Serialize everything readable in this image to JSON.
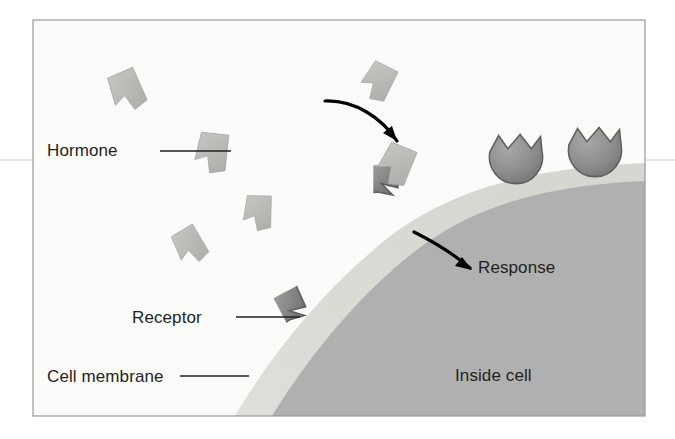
{
  "figure": {
    "background_color": "#ffffff",
    "panel": {
      "x": 33,
      "y": 20,
      "width": 612,
      "height": 396,
      "outside_fill": "#fbfbfa",
      "border_color": "#9a9a9a"
    },
    "colors": {
      "outside_cell": "#fbfbfa",
      "cell_membrane": "#dcdcd6",
      "inside_cell": "#b0b0b0",
      "hormone_fill": "#b9b9b6",
      "hormone_stroke": "#a3a3a0",
      "receptor_fill": "#8f8f8f",
      "receptor_stroke": "#5f5f5f",
      "text": "#231f20",
      "arrow": "#000000",
      "leader": "#231f20",
      "panel_border": "#9a9a9a",
      "scan_line": "#c9c9c9"
    },
    "labels": [
      {
        "id": "hormone",
        "text": "Hormone",
        "x": 47,
        "y": 156,
        "anchor": "start",
        "leader": "M 160 151 L 231 151"
      },
      {
        "id": "receptor",
        "text": "Receptor",
        "x": 132,
        "y": 323,
        "anchor": "start",
        "leader": "M 236 317 L 300 317"
      },
      {
        "id": "cell-membrane",
        "text": "Cell membrane",
        "x": 47,
        "y": 382,
        "anchor": "start",
        "leader": "M 180 376 L 249 376"
      },
      {
        "id": "response",
        "text": "Response",
        "x": 478,
        "y": 273,
        "anchor": "start",
        "leader": ""
      },
      {
        "id": "inside-cell",
        "text": "Inside cell",
        "x": 455,
        "y": 381,
        "anchor": "start",
        "leader": ""
      }
    ],
    "arrows": [
      {
        "id": "binding-arrow",
        "description": "curved arrow from free hormone toward the receptor binding site",
        "path": "M 325 101 C 355 100 382 118 397 141",
        "head": "M 397 141 L 383 133 L 392 126 Z"
      },
      {
        "id": "response-arrow",
        "description": "curved arrow from bound receptor into the cell interior",
        "path": "M 414 232 C 436 243 456 256 470 268",
        "head": "M 472 270 L 455 266 L 462 257 Z"
      }
    ],
    "hormones": [
      {
        "id": "hormone-1",
        "cx": 127,
        "cy": 91,
        "rotation": -18,
        "scale": 1.0
      },
      {
        "id": "hormone-2",
        "cx": 212,
        "cy": 153,
        "rotation": 12,
        "scale": 1.0
      },
      {
        "id": "hormone-3",
        "cx": 258,
        "cy": 213,
        "rotation": 7,
        "scale": 0.88
      },
      {
        "id": "hormone-4",
        "cx": 190,
        "cy": 246,
        "rotation": -25,
        "scale": 0.9
      },
      {
        "id": "hormone-5",
        "cx": 378,
        "cy": 82,
        "rotation": 32,
        "scale": 0.92
      },
      {
        "id": "hormone-6",
        "cx": 396,
        "cy": 165,
        "rotation": 28,
        "scale": 1.0
      }
    ],
    "receptors": [
      {
        "id": "receptor-bound",
        "cx": 404,
        "cy": 196,
        "r": 26,
        "notch": "single",
        "state": "hormone-bound"
      },
      {
        "id": "receptor-free-left",
        "cx": 315,
        "cy": 311,
        "r": 26,
        "notch": "single",
        "state": "unbound"
      },
      {
        "id": "receptor-free-mid",
        "cx": 516,
        "cy": 159,
        "r": 26,
        "notch": "crown",
        "state": "unbound"
      },
      {
        "id": "receptor-free-right",
        "cx": 595,
        "cy": 152,
        "r": 26,
        "notch": "crown",
        "state": "unbound"
      }
    ],
    "membrane": {
      "description": "curved lipid bilayer band sweeping from lower-left to upper-right",
      "outer_edge": "M 235 416 C 268 360 318 296 378 246 C 440 194 520 168 645 163 L 645 416 Z",
      "inner_edge": "M 272 416 C 305 362 350 305 404 260 C 462 212 530 186 645 181 L 645 416 Z"
    },
    "scan_line_y": 160
  }
}
